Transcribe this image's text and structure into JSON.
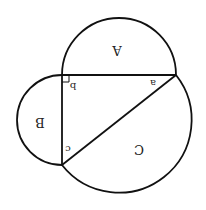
{
  "diagram": {
    "orientation": "rotated-180",
    "stroke_color": "#111111",
    "background": "#ffffff",
    "regions": {
      "A": "A",
      "B": "B",
      "C": "C"
    },
    "angles": {
      "a": "a",
      "b": "b",
      "c": "c"
    },
    "right_angle_at": "b"
  }
}
